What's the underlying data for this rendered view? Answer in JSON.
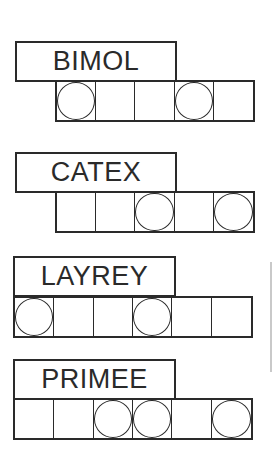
{
  "puzzles": [
    {
      "scrambled": "BIMOL",
      "cells": 5,
      "circled": [
        0,
        3
      ]
    },
    {
      "scrambled": "CATEX",
      "cells": 5,
      "circled": [
        2,
        4
      ]
    },
    {
      "scrambled": "LAYREY",
      "cells": 6,
      "circled": [
        0,
        3
      ]
    },
    {
      "scrambled": "PRIMEE",
      "cells": 6,
      "circled": [
        2,
        3,
        5
      ]
    }
  ],
  "colors": {
    "ink": "#2a2a2a",
    "background": "#ffffff"
  }
}
